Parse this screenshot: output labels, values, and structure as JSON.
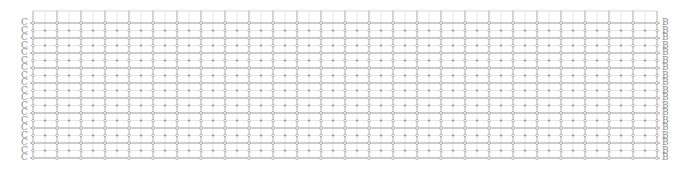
{
  "diagram": {
    "type": "lattice-grid",
    "left_label": "C",
    "right_label": "B",
    "rows": 19,
    "columns": 53,
    "grid": {
      "x_start": 33,
      "x_end": 657,
      "y_frame_top": 11,
      "y_start": 23,
      "row_spacing": 7.5,
      "col_spacing": 12
    },
    "colors": {
      "major_line": "#9a9a9a",
      "minor_line": "#d6d6d6",
      "node": "#8c8c8c",
      "label": "#8a8a8a"
    }
  }
}
